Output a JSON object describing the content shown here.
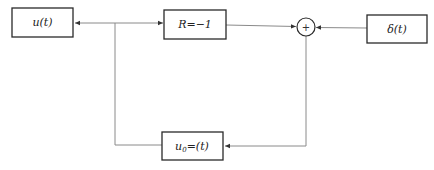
{
  "diagram": {
    "type": "block-diagram",
    "blocks": [
      {
        "id": "u",
        "label": "u(t)"
      },
      {
        "id": "R",
        "label": "R=−1"
      },
      {
        "id": "delta",
        "label": "δ(t)"
      },
      {
        "id": "u0",
        "label_main": "u",
        "label_sub": "0",
        "label_rest": "=(t)"
      }
    ],
    "summing_junction": {
      "symbol": "+"
    },
    "connections": [
      {
        "from": "junction-left",
        "to": "u",
        "arrow": true
      },
      {
        "from": "junction-left",
        "to": "R",
        "arrow": true
      },
      {
        "from": "R",
        "to": "summing_junction",
        "arrow": true
      },
      {
        "from": "delta",
        "to": "summing_junction",
        "arrow": true
      },
      {
        "from": "summing_junction",
        "to": "u0",
        "arrow": true
      },
      {
        "from": "u0",
        "to": "junction-left",
        "arrow": false
      }
    ]
  }
}
